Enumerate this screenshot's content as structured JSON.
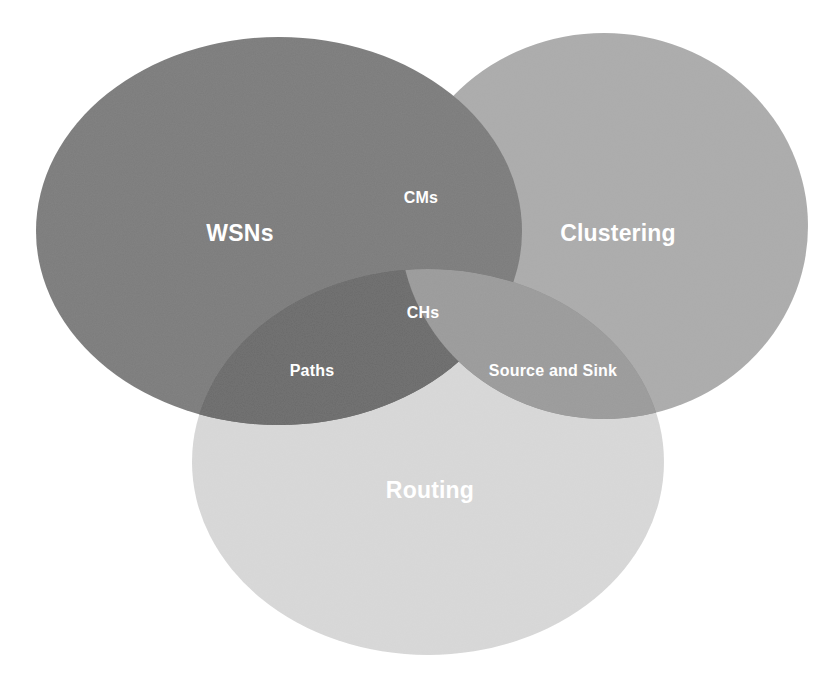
{
  "diagram": {
    "type": "venn",
    "sets": [
      {
        "id": "wsns",
        "label": "WSNs",
        "color": "#7b7b7b",
        "cx": 279,
        "cy": 231,
        "rx": 243,
        "ry": 194
      },
      {
        "id": "clustering",
        "label": "Clustering",
        "color": "#acacac",
        "cx": 604,
        "cy": 226,
        "rx": 204,
        "ry": 193
      },
      {
        "id": "routing",
        "label": "Routing",
        "color": "#d9d9d9",
        "cx": 428,
        "cy": 462,
        "rx": 236,
        "ry": 193
      }
    ],
    "intersections": [
      {
        "id": "wsns-clustering-top",
        "label": "CMs",
        "sets": [
          "WSNs",
          "Clustering"
        ]
      },
      {
        "id": "wsns-clustering-center",
        "label": "CHs",
        "sets": [
          "WSNs",
          "Clustering"
        ]
      },
      {
        "id": "wsns-routing",
        "label": "Paths",
        "sets": [
          "WSNs",
          "Routing"
        ]
      },
      {
        "id": "clustering-routing",
        "label": "Source and Sink",
        "sets": [
          "Clustering",
          "Routing"
        ]
      }
    ],
    "colors": {
      "background": "#ffffff",
      "text": "#ffffff",
      "routing_overlay": "#d9d9d9"
    }
  }
}
